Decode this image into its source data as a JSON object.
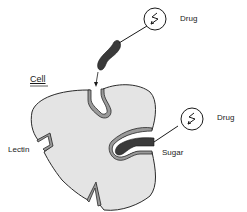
{
  "diagram": {
    "type": "biology-schematic",
    "labels": {
      "cell": "Cell",
      "lectin": "Lectin",
      "sugar": "Sugar",
      "drug_top": "Drug",
      "drug_right": "Drug"
    },
    "colors": {
      "cell_fill": "#e4e4e4",
      "outline": "#2a2a2a",
      "receptor_band": "#9a9a9a",
      "sugar_fill": "#3a3a3a",
      "background": "#ffffff"
    },
    "icons": {
      "drug": "lightning-bolt-in-circle"
    }
  }
}
